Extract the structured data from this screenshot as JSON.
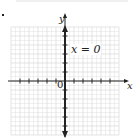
{
  "chart_data": {
    "type": "line",
    "title": "",
    "equation_label": "x = 0",
    "xlabel": "x",
    "ylabel": "y",
    "origin_label": "0",
    "xlim": [
      -6,
      6
    ],
    "ylim": [
      -6,
      6
    ],
    "grid": true,
    "series": [
      {
        "name": "x = 0",
        "x": [
          0,
          0
        ],
        "y": [
          -6,
          6
        ],
        "color": "#222222",
        "arrows": "both"
      }
    ]
  },
  "colors": {
    "axis": "#222222",
    "grid": "#d8d8d8",
    "line": "#222222"
  }
}
